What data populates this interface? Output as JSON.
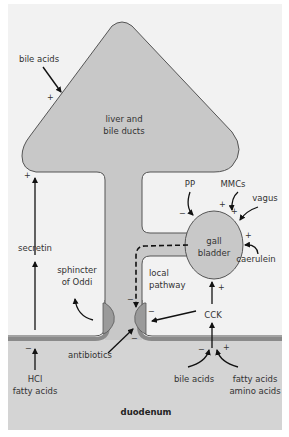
{
  "colors": {
    "background": "#f2f2f2",
    "organ_fill": "#c8c8c8",
    "organ_stroke": "#555555",
    "duodenum_fill": "#d4d4d4",
    "wall": "#8a8a8a",
    "sphincter": "#9a9a9a",
    "arrow": "#111111",
    "text": "#333333"
  },
  "organs": {
    "liver": "liver and\nbile ducts",
    "liver_line1": "liver and",
    "liver_line2": "bile ducts",
    "gallbladder_line1": "gall",
    "gallbladder_line2": "bladder",
    "duodenum": "duodenum",
    "sphincter_line1": "sphincter",
    "sphincter_line2": "of Oddi",
    "local_line1": "local",
    "local_line2": "pathway"
  },
  "stimuli": {
    "bile_acids_top": {
      "label": "bile acids",
      "sign": "+"
    },
    "secretin": {
      "label": "secretin",
      "sign": "+"
    },
    "hcl": {
      "line1": "HCl",
      "line2": "fatty acids",
      "sign": "−"
    },
    "antibiotics": {
      "label": "antibiotics",
      "sign": "−"
    },
    "pp": {
      "label": "PP",
      "sign": "−"
    },
    "mmcs": {
      "label": "MMCs",
      "sign": "+"
    },
    "vagus": {
      "label": "vagus",
      "sign": "+"
    },
    "caerulein": {
      "label": "caerulein",
      "sign": "+"
    },
    "cck": {
      "label": "CCK",
      "sign_gb": "+",
      "sign_sphincter": "−"
    },
    "local_sign": "−",
    "bile_acids_bottom": {
      "label": "bile acids",
      "sign": "−"
    },
    "fatty_amino": {
      "line1": "fatty acids",
      "line2": "amino acids",
      "sign": "+"
    }
  }
}
